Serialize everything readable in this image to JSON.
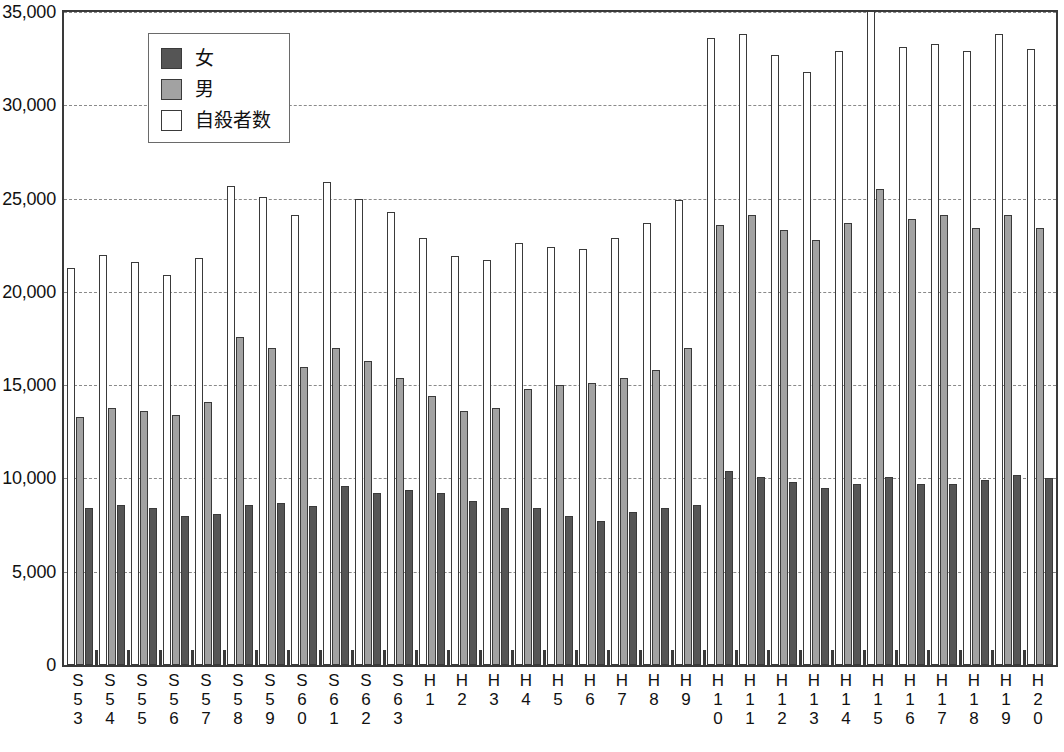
{
  "chart_data": {
    "type": "bar",
    "title": "",
    "xlabel": "",
    "ylabel": "",
    "ylim": [
      0,
      35000
    ],
    "ytick_step": 5000,
    "ytick_labels": [
      "0",
      "5,000",
      "10,000",
      "15,000",
      "20,000",
      "25,000",
      "30,000",
      "35,000"
    ],
    "ytick_values": [
      0,
      5000,
      10000,
      15000,
      20000,
      25000,
      30000,
      35000
    ],
    "grid": true,
    "grid_style": "dashed-horizontal",
    "legend_position": "top-left",
    "bar_order": [
      "自殺者数",
      "男",
      "女"
    ],
    "categories": [
      "S53",
      "S54",
      "S55",
      "S56",
      "S57",
      "S58",
      "S59",
      "S60",
      "S61",
      "S62",
      "S63",
      "H1",
      "H2",
      "H3",
      "H4",
      "H5",
      "H6",
      "H7",
      "H8",
      "H9",
      "H10",
      "H11",
      "H12",
      "H13",
      "H14",
      "H15",
      "H16",
      "H17",
      "H18",
      "H19",
      "H20"
    ],
    "category_label_lines": [
      [
        "S",
        "5",
        "3"
      ],
      [
        "S",
        "5",
        "4"
      ],
      [
        "S",
        "5",
        "5"
      ],
      [
        "S",
        "5",
        "6"
      ],
      [
        "S",
        "5",
        "7"
      ],
      [
        "S",
        "5",
        "8"
      ],
      [
        "S",
        "5",
        "9"
      ],
      [
        "S",
        "6",
        "0"
      ],
      [
        "S",
        "6",
        "1"
      ],
      [
        "S",
        "6",
        "2"
      ],
      [
        "S",
        "6",
        "3"
      ],
      [
        "H",
        "1"
      ],
      [
        "H",
        "2"
      ],
      [
        "H",
        "3"
      ],
      [
        "H",
        "4"
      ],
      [
        "H",
        "5"
      ],
      [
        "H",
        "6"
      ],
      [
        "H",
        "7"
      ],
      [
        "H",
        "8"
      ],
      [
        "H",
        "9"
      ],
      [
        "H",
        "1",
        "0"
      ],
      [
        "H",
        "1",
        "1"
      ],
      [
        "H",
        "1",
        "2"
      ],
      [
        "H",
        "1",
        "3"
      ],
      [
        "H",
        "1",
        "4"
      ],
      [
        "H",
        "1",
        "5"
      ],
      [
        "H",
        "1",
        "6"
      ],
      [
        "H",
        "1",
        "7"
      ],
      [
        "H",
        "1",
        "8"
      ],
      [
        "H",
        "1",
        "9"
      ],
      [
        "H",
        "2",
        "0"
      ]
    ],
    "series": [
      {
        "name": "自殺者数",
        "color": "#ffffff",
        "values": [
          21300,
          22000,
          21600,
          20900,
          21800,
          25700,
          25100,
          24100,
          25900,
          25000,
          24300,
          22900,
          21900,
          21700,
          22600,
          22400,
          22300,
          22900,
          23700,
          24900,
          33600,
          33800,
          32700,
          31800,
          32900,
          35100,
          33100,
          33300,
          32900,
          33800,
          33000
        ]
      },
      {
        "name": "男",
        "color": "#a2a2a2",
        "values": [
          13300,
          13800,
          13600,
          13400,
          14100,
          17600,
          17000,
          16000,
          17000,
          16300,
          15400,
          14400,
          13600,
          13800,
          14800,
          15000,
          15100,
          15400,
          15800,
          17000,
          23600,
          24100,
          23300,
          22800,
          23700,
          25500,
          23900,
          24100,
          23400,
          24100,
          23400
        ]
      },
      {
        "name": "女",
        "color": "#555555",
        "values": [
          8400,
          8600,
          8400,
          8000,
          8100,
          8600,
          8700,
          8500,
          9600,
          9200,
          9400,
          9200,
          8800,
          8400,
          8400,
          8000,
          7700,
          8200,
          8400,
          8600,
          10400,
          10100,
          9800,
          9500,
          9700,
          10100,
          9700,
          9700,
          9900,
          10200,
          10000
        ]
      }
    ]
  },
  "legend": {
    "items": [
      {
        "label": "女",
        "swatch": "female"
      },
      {
        "label": "男",
        "swatch": "male"
      },
      {
        "label": "自殺者数",
        "swatch": "total"
      }
    ]
  }
}
